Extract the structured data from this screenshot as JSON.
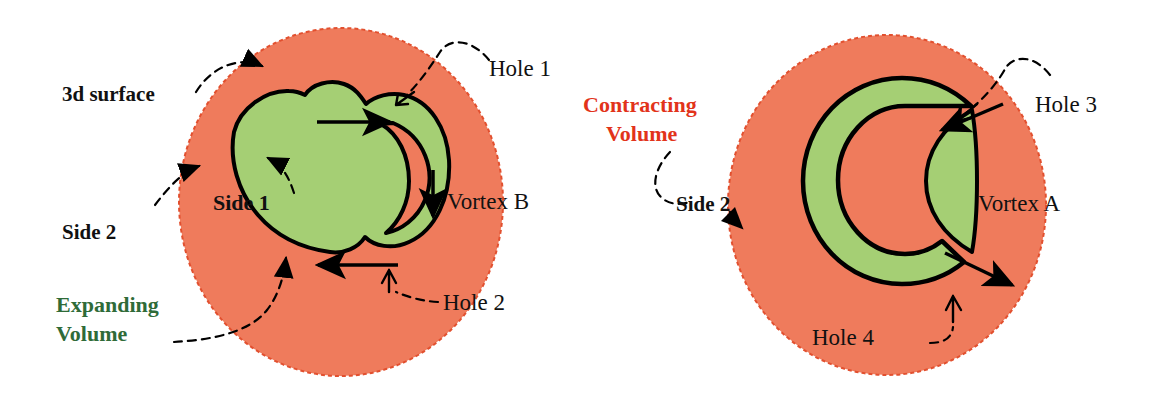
{
  "figure": {
    "colors": {
      "orange_fill": "#ef7b5c",
      "green_fill": "#a5cf74",
      "outline": "#000000",
      "green_text": "#2f6b38",
      "red_text": "#e2331a",
      "black_text": "#111111"
    }
  },
  "left_panel": {
    "labels": {
      "surface": "3d surface",
      "side2": "Side 2",
      "expanding_line1": "Expanding",
      "expanding_line2": "Volume",
      "side1": "Side 1",
      "hole1": "Hole 1",
      "hole2": "Hole 2",
      "vortex_b": "Vortex B"
    }
  },
  "right_panel": {
    "labels": {
      "contracting_line1": "Contracting",
      "contracting_line2": "Volume",
      "side2": "Side 2",
      "hole3": "Hole 3",
      "hole4": "Hole 4",
      "vortex_a": "Vortex A"
    }
  }
}
